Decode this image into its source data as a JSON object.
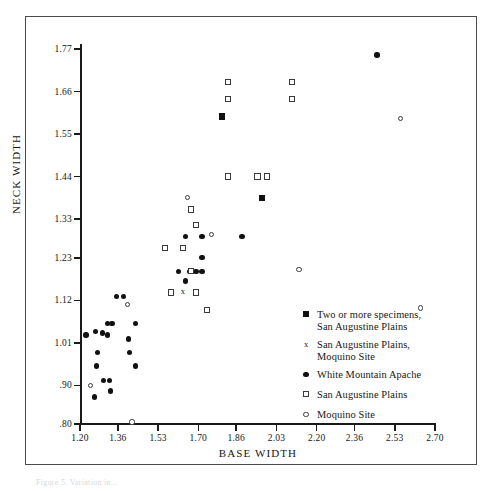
{
  "figure": {
    "caption": "Figure 5. Variation in..."
  },
  "chart_data": {
    "type": "scatter",
    "title": "",
    "xlabel": "BASE WIDTH",
    "ylabel": "NECK WIDTH",
    "xlim": [
      1.2,
      2.7
    ],
    "ylim": [
      0.8,
      1.77
    ],
    "grid": false,
    "legend_position": "inside-bottom-right",
    "xticks": [
      "1.20",
      "1.36",
      "1.53",
      "1.70",
      "1.86",
      "2.03",
      "2.20",
      "2.36",
      "2.53",
      "2.70"
    ],
    "xtick_values": [
      1.2,
      1.36,
      1.53,
      1.7,
      1.86,
      2.03,
      2.2,
      2.36,
      2.53,
      2.7
    ],
    "yticks": [
      "1.77",
      "1.66",
      "1.55",
      "1.44",
      "1.33",
      "1.23",
      "1.12",
      "1.01",
      ".90",
      ".80"
    ],
    "ytick_values": [
      1.77,
      1.66,
      1.55,
      1.44,
      1.33,
      1.23,
      1.12,
      1.01,
      0.9,
      0.8
    ],
    "series": [
      {
        "name": "Two or more specimens, San Augustine Plains",
        "marker": "filled-square",
        "points": [
          [
            1.8,
            1.595
          ],
          [
            1.97,
            1.385
          ]
        ]
      },
      {
        "name": "San Augustine Plains, Moquino Site",
        "marker": "cross",
        "points": [
          [
            1.635,
            1.145
          ]
        ]
      },
      {
        "name": "White Mountain Apache",
        "marker": "filled-circle",
        "points": [
          [
            2.455,
            1.755
          ],
          [
            1.645,
            1.285
          ],
          [
            1.715,
            1.285
          ],
          [
            1.885,
            1.285
          ],
          [
            1.715,
            1.23
          ],
          [
            1.615,
            1.195
          ],
          [
            1.665,
            1.195
          ],
          [
            1.69,
            1.195
          ],
          [
            1.715,
            1.195
          ],
          [
            1.645,
            1.17
          ],
          [
            1.355,
            1.13
          ],
          [
            1.385,
            1.13
          ],
          [
            1.315,
            1.06
          ],
          [
            1.335,
            1.06
          ],
          [
            1.435,
            1.06
          ],
          [
            1.265,
            1.04
          ],
          [
            1.295,
            1.035
          ],
          [
            1.315,
            1.03
          ],
          [
            1.225,
            1.03
          ],
          [
            1.405,
            1.02
          ],
          [
            1.41,
            0.985
          ],
          [
            1.275,
            0.985
          ],
          [
            1.27,
            0.95
          ],
          [
            1.435,
            0.95
          ],
          [
            1.3,
            0.912
          ],
          [
            1.325,
            0.912
          ],
          [
            1.33,
            0.885
          ],
          [
            1.26,
            0.87
          ]
        ]
      },
      {
        "name": "San Augustine Plains",
        "marker": "open-square",
        "points": [
          [
            1.825,
            1.685
          ],
          [
            2.095,
            1.685
          ],
          [
            1.825,
            1.64
          ],
          [
            2.095,
            1.64
          ],
          [
            1.825,
            1.44
          ],
          [
            1.95,
            1.44
          ],
          [
            1.99,
            1.44
          ],
          [
            1.67,
            1.355
          ],
          [
            1.69,
            1.315
          ],
          [
            1.56,
            1.255
          ],
          [
            1.635,
            1.255
          ],
          [
            1.67,
            1.195
          ],
          [
            1.585,
            1.14
          ],
          [
            1.69,
            1.14
          ],
          [
            1.735,
            1.095
          ]
        ]
      },
      {
        "name": "Moquino Site",
        "marker": "open-circle",
        "points": [
          [
            2.555,
            1.59
          ],
          [
            1.655,
            1.385
          ],
          [
            1.755,
            1.29
          ],
          [
            2.125,
            1.2
          ],
          [
            2.64,
            1.1
          ],
          [
            1.4,
            1.11
          ],
          [
            1.245,
            0.9
          ],
          [
            1.42,
            0.805
          ]
        ]
      }
    ]
  },
  "legend": {
    "entries": [
      {
        "marker": "filled-square",
        "line1": "Two or more specimens,",
        "line2": "San Augustine Plains"
      },
      {
        "marker": "cross",
        "line1": "San Augustine Plains,",
        "line2": "Moquino Site"
      },
      {
        "marker": "filled-circle",
        "line1": "White Mountain Apache",
        "line2": ""
      },
      {
        "marker": "open-square",
        "line1": "San Augustine Plains",
        "line2": ""
      },
      {
        "marker": "open-circle",
        "line1": "Moquino Site",
        "line2": ""
      }
    ]
  }
}
